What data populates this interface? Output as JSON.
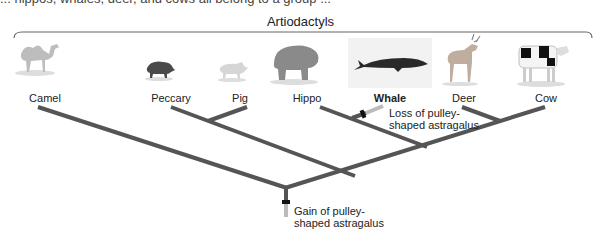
{
  "header": {
    "cut_text": "... hippos, whales, deer, and cows all belong to a group ...",
    "group_label": "Artiodactyls"
  },
  "taxa": [
    {
      "id": "camel",
      "label": "Camel",
      "x": 38,
      "bold": false
    },
    {
      "id": "peccary",
      "label": "Peccary",
      "x": 171,
      "bold": false
    },
    {
      "id": "pig",
      "label": "Pig",
      "x": 247,
      "bold": false
    },
    {
      "id": "hippo",
      "label": "Hippo",
      "x": 320,
      "bold": false
    },
    {
      "id": "whale",
      "label": "Whale",
      "x": 390,
      "bold": true
    },
    {
      "id": "deer",
      "label": "Deer",
      "x": 462,
      "bold": false
    },
    {
      "id": "cow",
      "label": "Cow",
      "x": 545,
      "bold": false
    }
  ],
  "annotations": {
    "loss": {
      "line1": "Loss of pulley-",
      "line2": "shaped astragalus"
    },
    "gain": {
      "line1": "Gain of pulley-",
      "line2": "shaped astragalus"
    }
  },
  "colors": {
    "branch": "#555555",
    "trait_marker": "#111111",
    "trait_stub": "#bbbbbb"
  }
}
